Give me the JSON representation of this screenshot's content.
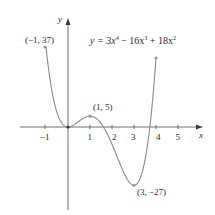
{
  "chart_data": {
    "type": "line",
    "xlabel": "x",
    "ylabel": "y",
    "x_ticks": [
      "-1",
      "1",
      "2",
      "3",
      "4",
      "5"
    ],
    "xlim": [
      -1.8,
      5.6
    ],
    "ylim": [
      -38,
      44
    ],
    "grid": false,
    "legend": null,
    "function": "3x^4 - 16x^3 + 18x^2",
    "domain": [
      -1,
      4
    ],
    "series": [
      {
        "name": "y = 3x^4 - 16x^3 + 18x^2",
        "x": [
          -1,
          -0.5,
          0,
          0.5,
          1,
          1.5,
          2,
          2.5,
          3,
          3.5,
          4
        ],
        "y": [
          37,
          6.6875,
          0,
          2.6875,
          5,
          0.1875,
          -8,
          -19.0625,
          -27,
          -18.8125,
          32
        ]
      }
    ],
    "annotations": [
      {
        "label": "(−1, 37)",
        "x": -1,
        "y": 37
      },
      {
        "label": "(1, 5)",
        "x": 1,
        "y": 5
      },
      {
        "label": "(3, −27)",
        "x": 3,
        "y": -27
      }
    ]
  },
  "labels": {
    "equation_prefix": "y = 3x",
    "exp4": "4",
    "eq_mid": " − 16x",
    "exp3": "3",
    "eq_end": " + 18x",
    "exp2": "2",
    "x_axis": "x",
    "y_axis": "y",
    "pt_left": "(−1, 37)",
    "pt_max": "(1, 5)",
    "pt_min": "(3, −27)",
    "tick_m1": "−1",
    "tick_1": "1",
    "tick_2": "2",
    "tick_3": "3",
    "tick_4": "4",
    "tick_5": "5"
  },
  "colors": {
    "curve": "#8a8a8a",
    "axis": "#6e6e6e",
    "text": "#2a2a2a",
    "point": "#9a9a9a"
  }
}
